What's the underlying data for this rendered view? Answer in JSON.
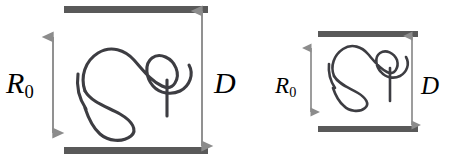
{
  "figure": {
    "name": "polymer-confined-between-plates",
    "caption_text": "",
    "background_color": "#ffffff",
    "plate_color": "#595959",
    "arrow_color": "#8c8c8c",
    "chain_color": "#3d3d42",
    "label_color": "#000000",
    "panels": [
      {
        "id": "left-panel",
        "name": "unconfined-coil-panel",
        "state": "unconfined",
        "gap_label": "D",
        "coil_label": "R",
        "coil_label_subscript": "0",
        "plate_gap_px": 144,
        "coil_size_px": 96,
        "top_plate": {
          "x1": 64,
          "x2": 208,
          "y": 6,
          "thickness": 7
        },
        "bottom_plate": {
          "x1": 64,
          "x2": 208,
          "y": 147,
          "thickness": 7
        },
        "coil_arrow": {
          "x": 53,
          "y1": 37,
          "y2": 133
        },
        "gap_arrow": {
          "x": 202,
          "y1": 11,
          "y2": 144
        }
      },
      {
        "id": "right-panel",
        "name": "compressed-coil-panel",
        "state": "compressed",
        "gap_label": "D",
        "coil_label": "R",
        "coil_label_subscript": "0",
        "plate_gap_px": 95,
        "coil_size_px": 64,
        "top_plate": {
          "x1": 318,
          "x2": 418,
          "y": 31,
          "thickness": 6
        },
        "bottom_plate": {
          "x1": 318,
          "x2": 418,
          "y": 126,
          "thickness": 6
        },
        "coil_arrow": {
          "x": 311,
          "y1": 48,
          "y2": 112
        },
        "gap_arrow": {
          "x": 412,
          "y1": 36,
          "y2": 123
        }
      }
    ],
    "labels": [
      {
        "id": "r0-left",
        "name": "coil-radius-label-left",
        "text": "R",
        "subscript": "0"
      },
      {
        "id": "d-left",
        "name": "plate-gap-label-left",
        "text": "D",
        "subscript": ""
      },
      {
        "id": "r0-right",
        "name": "coil-radius-label-right",
        "text": "R",
        "subscript": "0"
      },
      {
        "id": "d-right",
        "name": "plate-gap-label-right",
        "text": "D",
        "subscript": ""
      }
    ]
  }
}
